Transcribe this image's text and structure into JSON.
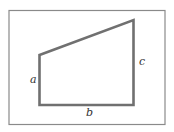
{
  "diagram": {
    "type": "trapezoid",
    "labels": {
      "a": "a",
      "b": "b",
      "c": "c"
    },
    "colors": {
      "frame": "#8a8a8a",
      "shape": "#707070",
      "text": "#333333"
    }
  }
}
